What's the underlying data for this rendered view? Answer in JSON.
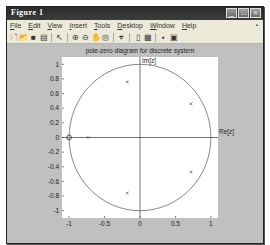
{
  "window": {
    "title": "Figure 1",
    "buttons": [
      "minimize",
      "maximize",
      "close"
    ]
  },
  "menubar": {
    "items": [
      "File",
      "Edit",
      "View",
      "Insert",
      "Tools",
      "Desktop",
      "Window",
      "Help"
    ]
  },
  "toolbar": {
    "tools": [
      "new-figure-icon",
      "open-file-icon",
      "save-icon",
      "print-icon",
      "|",
      "select-arrow-icon",
      "|",
      "zoom-in-icon",
      "zoom-out-icon",
      "pan-hand-icon",
      "rotate-3d-icon",
      "|",
      "data-cursor-icon",
      "|",
      "colorbar-icon",
      "legend-icon",
      "|",
      "hide-plot-tools-icon",
      "show-plot-tools-icon"
    ]
  },
  "chart_data": {
    "type": "scatter",
    "title": "pole-zero diagram for discrete system",
    "xlabel": "Re[z]",
    "ylabel": "Im[z]",
    "xlim": [
      -1.1,
      1.1
    ],
    "ylim": [
      -1.1,
      1.1
    ],
    "xticks": [
      -1,
      -0.5,
      0,
      0.5,
      1
    ],
    "xtick_labels": [
      "-1",
      "-0.5",
      "0",
      "0.5",
      "1"
    ],
    "yticks": [
      1,
      0.8,
      0.6,
      0.4,
      0.2,
      0,
      -0.2,
      -0.4,
      -0.6,
      -0.8,
      -1
    ],
    "ytick_labels": [
      "1",
      "0.8",
      "0.6",
      "0.4",
      "0.2",
      "0",
      "-0.2",
      "-0.4",
      "-0.6",
      "-0.8",
      "-1"
    ],
    "unit_circle": true,
    "grid": false,
    "series": [
      {
        "name": "zeros",
        "marker": "o",
        "points": [
          [
            -1,
            0
          ]
        ]
      },
      {
        "name": "poles",
        "marker": "x",
        "points": [
          [
            -0.18,
            0.76
          ],
          [
            0.72,
            0.46
          ],
          [
            0.72,
            -0.47
          ],
          [
            -0.18,
            -0.76
          ],
          [
            -0.73,
            0
          ]
        ]
      }
    ]
  }
}
